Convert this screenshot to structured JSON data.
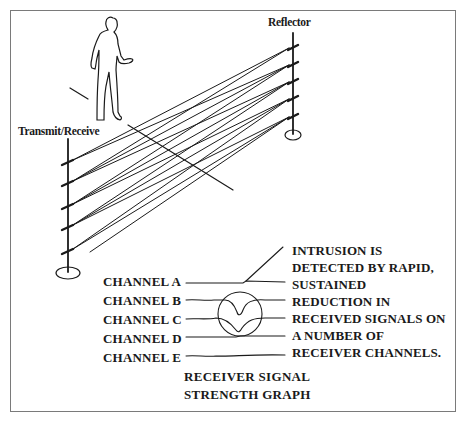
{
  "diagram": {
    "labels": {
      "transmit_receive": "Transmit/Receive",
      "reflector": "Reflector"
    },
    "channels": [
      {
        "label": "CHANNEL A"
      },
      {
        "label": "CHANNEL B"
      },
      {
        "label": "CHANNEL C"
      },
      {
        "label": "CHANNEL D"
      },
      {
        "label": "CHANNEL E"
      }
    ],
    "note_lines": [
      "INTRUSION IS",
      "DETECTED BY RAPID,",
      "SUSTAINED",
      "REDUCTION IN",
      "RECEIVED SIGNALS ON",
      "A NUMBER OF",
      "RECEIVER CHANNELS."
    ],
    "graph_caption": [
      "RECEIVER SIGNAL",
      "STRENGTH GRAPH"
    ],
    "icons": {
      "intruder": "person-silhouette-icon",
      "transmitter_pole": "transmit-receive-pole-icon",
      "reflector_pole": "reflector-pole-icon",
      "signal_dip_highlight": "circle-highlight-icon"
    },
    "colors": {
      "line": "#1a1a1a",
      "frame": "#7a7a7a",
      "background": "#ffffff"
    }
  }
}
